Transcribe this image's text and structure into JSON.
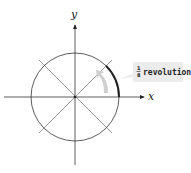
{
  "diagram": {
    "type": "unit-circle-rotation",
    "axes": {
      "x_label": "x",
      "y_label": "y"
    },
    "circle": {
      "center": [
        75,
        97
      ],
      "radius": 44
    },
    "lines": [
      "x-axis",
      "y-axis",
      "diagonal-45",
      "diagonal-135"
    ],
    "highlighted_arc": {
      "from_deg": 0,
      "to_deg": 45,
      "color": "#222222"
    },
    "callout": {
      "fraction_numerator": "1",
      "fraction_denominator": "8",
      "text": "revolution",
      "background": "#ececec"
    },
    "rotation_arrow_color": "#cfcfcf"
  }
}
